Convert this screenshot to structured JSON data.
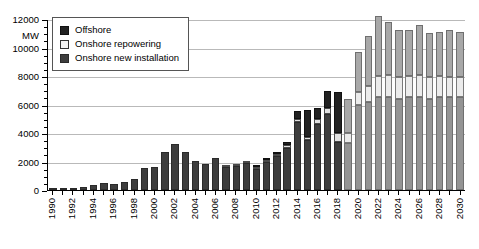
{
  "chart_data": {
    "type": "bar",
    "stacked": true,
    "title": "",
    "xlabel": "",
    "ylabel": "MW",
    "ylim": [
      0,
      12000
    ],
    "ytick_step": 2000,
    "yticks": [
      "0",
      "2000",
      "4000",
      "6000",
      "8000",
      "10000",
      "12000"
    ],
    "grid": true,
    "legend_position": "top-left",
    "axis_unit_label": "MW",
    "categories": [
      "1990",
      "1991",
      "1992",
      "1993",
      "1994",
      "1995",
      "1996",
      "1997",
      "1998",
      "1999",
      "2000",
      "2001",
      "2002",
      "2003",
      "2004",
      "2005",
      "2006",
      "2007",
      "2008",
      "2009",
      "2010",
      "2011",
      "2012",
      "2013",
      "2014",
      "2015",
      "2016",
      "2017",
      "2018",
      "2019",
      "2020",
      "2021",
      "2022",
      "2023",
      "2024",
      "2025",
      "2026",
      "2027",
      "2028",
      "2029",
      "2030"
    ],
    "xtick_labels_shown": [
      "1990",
      "1992",
      "1994",
      "1996",
      "1998",
      "2000",
      "2002",
      "2004",
      "2006",
      "2008",
      "2010",
      "2012",
      "2014",
      "2016",
      "2018",
      "2020",
      "2022",
      "2024",
      "2026",
      "2028",
      "2030"
    ],
    "series": [
      {
        "name": "Onshore new installation",
        "color": "#3d3d3d",
        "forecast_color": "#949494",
        "values": [
          40,
          60,
          120,
          180,
          320,
          480,
          430,
          530,
          790,
          1570,
          1650,
          2650,
          3250,
          2700,
          2050,
          1800,
          2230,
          1620,
          1660,
          1880,
          1490,
          1990,
          2400,
          2980,
          4750,
          3540,
          4600,
          5300,
          3400,
          3300,
          6000,
          6200,
          6500,
          6500,
          6400,
          6500,
          6500,
          6400,
          6500,
          6500,
          6500
        ]
      },
      {
        "name": "Onshore repowering",
        "color": "#e2e2e2",
        "forecast_color": "#ebebeb",
        "values": [
          0,
          0,
          0,
          0,
          0,
          0,
          0,
          0,
          0,
          0,
          0,
          0,
          0,
          0,
          0,
          0,
          0,
          60,
          100,
          130,
          110,
          150,
          160,
          160,
          240,
          160,
          370,
          430,
          600,
          700,
          900,
          1100,
          1500,
          1600,
          1500,
          1500,
          1550,
          1500,
          1500,
          1450,
          1400
        ]
      },
      {
        "name": "Offshore",
        "color": "#222222",
        "forecast_color": "#a8a8a8",
        "values": [
          0,
          0,
          0,
          0,
          0,
          0,
          0,
          0,
          0,
          0,
          0,
          0,
          0,
          0,
          0,
          0,
          0,
          0,
          0,
          0,
          50,
          110,
          80,
          240,
          530,
          1900,
          800,
          1250,
          2900,
          2400,
          2800,
          3500,
          4200,
          3700,
          3300,
          3200,
          3500,
          3100,
          3100,
          3300,
          3200
        ]
      }
    ],
    "forecast_start_year": "2019"
  },
  "legend": {
    "items": [
      {
        "label": "Offshore",
        "swatch": "offshore-swatch"
      },
      {
        "label": "Onshore repowering",
        "swatch": "onshore-repowering-swatch"
      },
      {
        "label": "Onshore new installation",
        "swatch": "onshore-new-installation-swatch"
      }
    ]
  }
}
